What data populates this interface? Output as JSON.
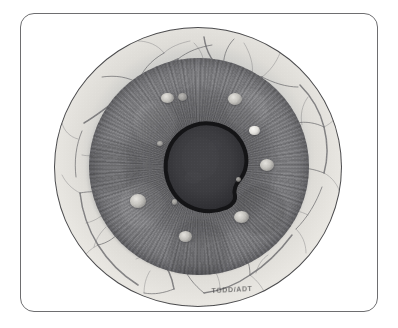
{
  "figure": {
    "kind": "clinical-eye-photograph",
    "modality": "grayscale photograph",
    "caption_stamp": "TODD/ADT",
    "frame": {
      "border_color": "#6e6e70",
      "background_color": "#ffffff",
      "corner_radius_px": 14
    }
  },
  "eye": {
    "globe": {
      "label": "eyeball",
      "outline_color": "#4b4b4d",
      "center_x_px": 198,
      "center_y_px": 167,
      "radius_px": 144
    },
    "sclera": {
      "label": "sclera",
      "color": "#e6e4df",
      "shadow_color": "#b3b1ac",
      "description": "pale outer ring with branching vessel network"
    },
    "iris": {
      "label": "iris",
      "color_light": "#7d7d80",
      "color_dark": "#4e4e52",
      "description": "mid-gray iris with fine radial striations"
    },
    "pupil": {
      "label": "pupil",
      "fill_color": "#3a3a3d",
      "rim_color": "#141416",
      "description": "irregular dark pupil with thick dark rim, slightly decentered"
    },
    "limbus": {
      "label": "limbus",
      "color": "#60606a"
    }
  },
  "vessels": {
    "label": "conjunctival vessel network",
    "stroke_color": "#4c4c50",
    "count": 34
  },
  "nodules": {
    "label": "iris nodules",
    "count": 11,
    "items": [
      {
        "id": "nodule-1",
        "name": "superior-left-nodule",
        "cx_pct": 36.0,
        "cy_pct": 18.5,
        "w_pct": 6.0,
        "h_pct": 5.0,
        "tone": "normal"
      },
      {
        "id": "nodule-2",
        "name": "superior-left-nodule-small",
        "cx_pct": 42.5,
        "cy_pct": 18.0,
        "w_pct": 4.0,
        "h_pct": 3.6,
        "tone": "dim"
      },
      {
        "id": "nodule-3",
        "name": "superior-right-nodule",
        "cx_pct": 66.5,
        "cy_pct": 19.0,
        "w_pct": 6.6,
        "h_pct": 5.6,
        "tone": "normal"
      },
      {
        "id": "nodule-4",
        "name": "temporal-bright-nodule",
        "cx_pct": 75.5,
        "cy_pct": 33.5,
        "w_pct": 5.0,
        "h_pct": 4.6,
        "tone": "bright"
      },
      {
        "id": "nodule-5",
        "name": "nasal-pupil-margin-nodule",
        "cx_pct": 32.5,
        "cy_pct": 39.5,
        "w_pct": 2.8,
        "h_pct": 2.6,
        "tone": "dim"
      },
      {
        "id": "nodule-6",
        "name": "temporal-mid-nodule",
        "cx_pct": 81.0,
        "cy_pct": 49.5,
        "w_pct": 6.4,
        "h_pct": 5.4,
        "tone": "normal"
      },
      {
        "id": "nodule-7",
        "name": "inferotemporal-tiny-nodule",
        "cx_pct": 68.0,
        "cy_pct": 56.0,
        "w_pct": 2.4,
        "h_pct": 2.2,
        "tone": "dim"
      },
      {
        "id": "nodule-8",
        "name": "nasal-inferior-nodule",
        "cx_pct": 22.5,
        "cy_pct": 66.0,
        "w_pct": 7.5,
        "h_pct": 6.2,
        "tone": "normal"
      },
      {
        "id": "nodule-9",
        "name": "inferonasal-tiny-nodule",
        "cx_pct": 39.0,
        "cy_pct": 66.5,
        "w_pct": 2.6,
        "h_pct": 2.4,
        "tone": "dim"
      },
      {
        "id": "nodule-10",
        "name": "inferotemporal-nodule",
        "cx_pct": 69.5,
        "cy_pct": 73.5,
        "w_pct": 7.0,
        "h_pct": 5.6,
        "tone": "normal"
      },
      {
        "id": "nodule-11",
        "name": "inferior-nodule",
        "cx_pct": 44.0,
        "cy_pct": 82.5,
        "w_pct": 6.0,
        "h_pct": 5.0,
        "tone": "normal"
      }
    ]
  }
}
